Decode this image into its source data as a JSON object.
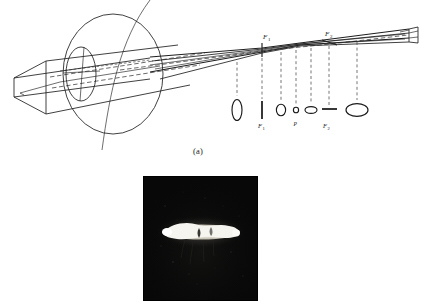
{
  "figure": {
    "kind": "optics-diagram-with-photograph",
    "panel_a": {
      "caption": "(a)",
      "description": "Astigmatic beam passing through a lens, showing beam cross-sections along the optical axis",
      "axis_labels": {
        "focal_line_1_upper": "F₁",
        "focal_line_2_upper": "F₂"
      },
      "cross_sections": [
        {
          "id": "cs-1",
          "shape": "vertical-ellipse",
          "label": "",
          "x": 237,
          "y": 110,
          "rx": 5.0,
          "ry": 10.5
        },
        {
          "id": "cs-2",
          "shape": "vertical-line",
          "label": "F₁",
          "x": 262,
          "y": 110,
          "rx": 0.9,
          "ry": 9.0
        },
        {
          "id": "cs-3",
          "shape": "circle",
          "label": "",
          "x": 281,
          "y": 110,
          "rx": 5.0,
          "ry": 6.0
        },
        {
          "id": "cs-4",
          "shape": "small-circle",
          "label": "P",
          "x": 296,
          "y": 110,
          "rx": 2.6,
          "ry": 2.8
        },
        {
          "id": "cs-5",
          "shape": "horizontal-ellipse-small",
          "label": "",
          "x": 311,
          "y": 110,
          "rx": 6.0,
          "ry": 3.6
        },
        {
          "id": "cs-6",
          "shape": "horizontal-line",
          "label": "F₂",
          "x": 329,
          "y": 110,
          "rx": 7.5,
          "ry": 0.9
        },
        {
          "id": "cs-7",
          "shape": "horizontal-ellipse",
          "label": "",
          "x": 357,
          "y": 110,
          "rx": 11.0,
          "ry": 6.5
        }
      ],
      "leader_lines": [
        {
          "from_x": 237,
          "from_y": 60,
          "to_y": 96
        },
        {
          "from_x": 262,
          "from_y": 47,
          "to_y": 98
        },
        {
          "from_x": 281,
          "from_y": 52,
          "to_y": 101
        },
        {
          "from_x": 296,
          "from_y": 52,
          "to_y": 104
        },
        {
          "from_x": 311,
          "from_y": 50,
          "to_y": 104
        },
        {
          "from_x": 329,
          "from_y": 45,
          "to_y": 106
        },
        {
          "from_x": 357,
          "from_y": 44,
          "to_y": 101
        }
      ]
    },
    "panel_b": {
      "description": "Photograph of the astigmatic focal streak",
      "background_color": "#080808",
      "streak_color": "#f2f0ea",
      "border_color": "#000000"
    }
  },
  "colors": {
    "ink": "#1a1a1a",
    "line": "#222222",
    "dash": "#555555",
    "paper": "#ffffff",
    "photo_bg": "#090909",
    "photo_streak": "#f4f2ec"
  }
}
